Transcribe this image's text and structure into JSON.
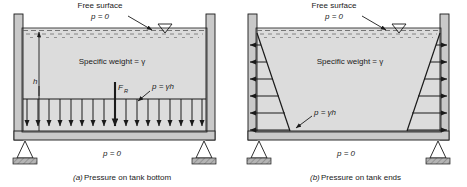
{
  "figure": {
    "background": "#ffffff",
    "ink": "#1a1a1a",
    "fluid_fill": "#dcdcdc",
    "wall_fill": "#c9c9c9",
    "support_fill": "#b5b5b5",
    "panels": [
      {
        "id": "panel-a",
        "caption_tag": "(a)",
        "caption_text": " Pressure on tank bottom",
        "labels": {
          "free_surface": "Free surface",
          "free_surface_pressure": "p = 0",
          "specific_weight": "Specific weight = γ",
          "depth": "h",
          "resultant_force": "F",
          "resultant_force_sub": "R",
          "pressure_relation": "p = γh",
          "bottom_pressure": "p = 0"
        },
        "arrow_count": 17,
        "arrow_direction": "down",
        "distribution": "uniform"
      },
      {
        "id": "panel-b",
        "caption_tag": "(b)",
        "caption_text": " Pressure on tank ends",
        "labels": {
          "free_surface": "Free surface",
          "free_surface_pressure": "p = 0",
          "specific_weight": "Specific weight = γ",
          "pressure_relation": "p = γh",
          "bottom_pressure": "p = 0"
        },
        "arrow_count": 6,
        "arrow_direction": "outward",
        "distribution": "triangular-linear-with-depth"
      }
    ]
  }
}
